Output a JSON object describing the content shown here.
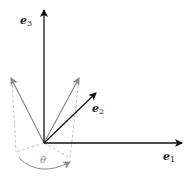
{
  "diagram": {
    "labels": {
      "e3": {
        "base": "e",
        "sub": "3"
      },
      "e2": {
        "base": "e",
        "sub": "2"
      },
      "e1": {
        "base": "e",
        "sub": "1"
      },
      "theta": "θ"
    },
    "colors": {
      "axis": "#111111",
      "rotated_vector": "#8a8a8a",
      "dashed": "#c8c8c8",
      "arc": "#8a8a8a"
    }
  }
}
